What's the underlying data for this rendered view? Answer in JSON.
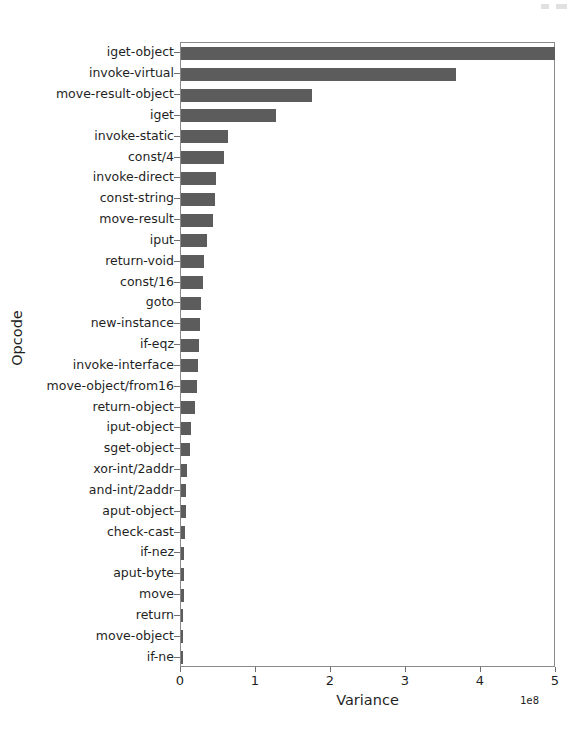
{
  "chart_data": {
    "type": "bar",
    "orientation": "horizontal",
    "title": "",
    "xlabel": "Variance",
    "ylabel": "Opcode",
    "x_tick_labels": [
      "0",
      "1",
      "2",
      "3",
      "4",
      "5"
    ],
    "x_ticks": [
      0,
      1,
      2,
      3,
      4,
      5
    ],
    "x_offset_text": "1e8",
    "x_scale_factor": 100000000,
    "xlim": [
      0,
      5
    ],
    "grid": false,
    "legend": null,
    "bar_color": "#5c5c5c",
    "axes_color": "#8a8a8a",
    "categories": [
      "iget-object",
      "invoke-virtual",
      "move-result-object",
      "iget",
      "invoke-static",
      "const/4",
      "invoke-direct",
      "const-string",
      "move-result",
      "iput",
      "return-void",
      "const/16",
      "goto",
      "new-instance",
      "if-eqz",
      "invoke-interface",
      "move-object/from16",
      "return-object",
      "iput-object",
      "sget-object",
      "xor-int/2addr",
      "and-int/2addr",
      "aput-object",
      "check-cast",
      "if-nez",
      "aput-byte",
      "move",
      "return",
      "move-object",
      "if-ne"
    ],
    "values": [
      4.99,
      3.66,
      1.74,
      1.26,
      0.62,
      0.57,
      0.46,
      0.45,
      0.42,
      0.35,
      0.3,
      0.29,
      0.27,
      0.25,
      0.24,
      0.23,
      0.21,
      0.18,
      0.13,
      0.12,
      0.08,
      0.07,
      0.06,
      0.05,
      0.045,
      0.04,
      0.035,
      0.03,
      0.025,
      0.02
    ],
    "value_units": "1e8"
  }
}
